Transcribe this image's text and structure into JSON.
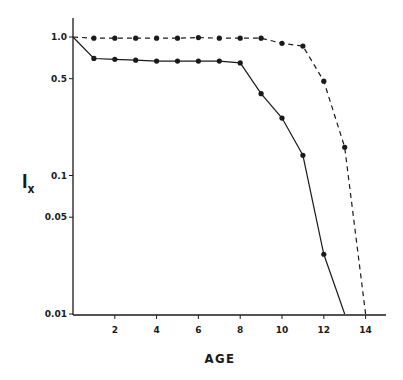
{
  "chart_data": {
    "type": "line",
    "title": "",
    "xlabel": "AGE",
    "ylabel": "l",
    "ylabel_subscript": "x",
    "yscale": "log",
    "xlim": [
      0,
      15
    ],
    "ylim": [
      0.01,
      1.25
    ],
    "grid": false,
    "legend": null,
    "x_ticks": [
      2,
      4,
      6,
      8,
      10,
      12,
      14
    ],
    "x_tick_labels": [
      "2",
      "4",
      "6",
      "8",
      "10",
      "12",
      "14"
    ],
    "y_ticks": [
      1.0,
      0.5,
      0.1,
      0.05,
      0.01
    ],
    "y_tick_labels": [
      "1.0",
      "0.5",
      "0.1",
      "0.05",
      "0.01"
    ],
    "series": [
      {
        "name": "solid",
        "style": "solid",
        "x": [
          0,
          1,
          2,
          3,
          4,
          5,
          6,
          7,
          8,
          9,
          10,
          11,
          12,
          13
        ],
        "values": [
          1.0,
          0.7,
          0.69,
          0.68,
          0.67,
          0.67,
          0.67,
          0.67,
          0.65,
          0.39,
          0.26,
          0.14,
          0.027,
          0.01
        ],
        "markers": [
          false,
          true,
          true,
          true,
          true,
          true,
          true,
          true,
          true,
          true,
          true,
          true,
          true,
          false
        ]
      },
      {
        "name": "dashed",
        "style": "dashed",
        "x": [
          0,
          1,
          2,
          3,
          4,
          5,
          6,
          7,
          8,
          9,
          10,
          11,
          12,
          13,
          14
        ],
        "values": [
          1.0,
          0.98,
          0.98,
          0.98,
          0.98,
          0.98,
          0.99,
          0.98,
          0.98,
          0.98,
          0.9,
          0.86,
          0.48,
          0.16,
          0.01
        ],
        "markers": [
          false,
          true,
          true,
          true,
          true,
          true,
          true,
          true,
          true,
          true,
          true,
          true,
          true,
          true,
          false
        ]
      }
    ]
  },
  "layout": {
    "origin_x": 73,
    "px_per_year": 20.9,
    "y_at_1": 37,
    "px_per_decade": 138.5,
    "x_axis_y": 315,
    "x_axis_end": 386,
    "y_axis_top": 18,
    "line_color": "#1a1a1a"
  }
}
